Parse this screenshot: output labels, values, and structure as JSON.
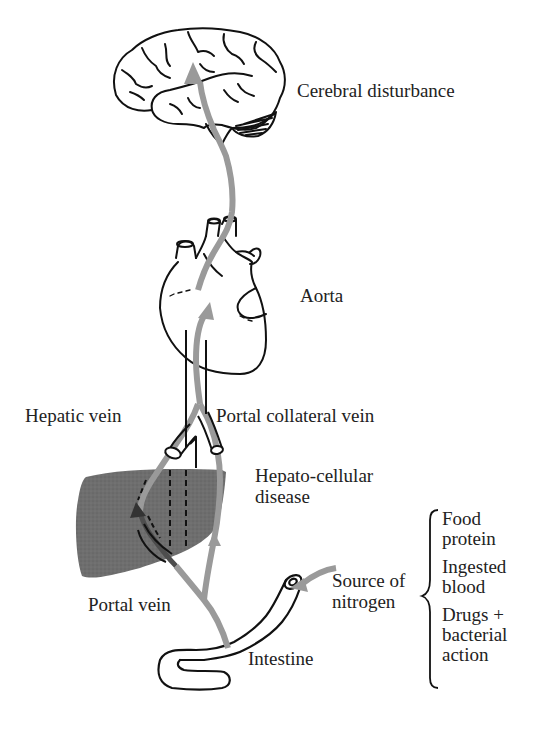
{
  "diagram": {
    "colors": {
      "flow_arrow": "#9a9a9a",
      "liver_fill": "#6b6b6b",
      "outline": "#111111",
      "text": "#222222",
      "background": "#ffffff"
    },
    "labels": {
      "cerebral": "Cerebral disturbance",
      "aorta": "Aorta",
      "hepatic_vein": "Hepatic vein",
      "portal_collateral_vein": "Portal collateral vein",
      "hepato_cellular": "Hepato-cellular\ndisease",
      "portal_vein": "Portal vein",
      "intestine": "Intestine",
      "source_of_nitrogen": "Source of\nnitrogen"
    },
    "nitrogen_sources": [
      {
        "label": "Food\nprotein"
      },
      {
        "label": "Ingested\nblood"
      },
      {
        "label": "Drugs +\nbacterial\naction"
      }
    ],
    "organs": [
      "brain",
      "heart",
      "liver",
      "intestine"
    ],
    "icons": {
      "brain": "brain-icon",
      "heart": "heart-icon",
      "liver": "liver-icon",
      "intestine": "intestine-icon",
      "flow": "arrow-icon",
      "brace": "curly-brace-icon"
    }
  }
}
